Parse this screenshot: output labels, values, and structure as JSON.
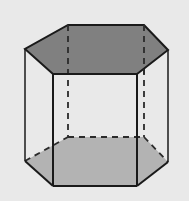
{
  "figure": {
    "canvas": {
      "width": 189,
      "height": 201
    },
    "background_color": "#e9e9e9",
    "colors": {
      "background": "#e9e9e9",
      "top_face_fill": "#808080",
      "bottom_face_fill": "#b3b3b3",
      "front_faces_fill": "#e9e9e9",
      "visible_edge": "#1a1a1a",
      "hidden_edge": "#2b2b2b"
    },
    "stroke": {
      "visible_width": 2.0,
      "hidden_width": 1.8,
      "hidden_dash": "6,5",
      "thin_width": 1.3
    },
    "geometry": {
      "top_hexagon": {
        "label": "top face",
        "fill": "#808080",
        "vertices": [
          {
            "name": "top-back-left",
            "x": 68,
            "y": 25
          },
          {
            "name": "top-back-right",
            "x": 144,
            "y": 25
          },
          {
            "name": "top-right",
            "x": 168,
            "y": 50
          },
          {
            "name": "top-front-right",
            "x": 137,
            "y": 74
          },
          {
            "name": "top-front-left",
            "x": 53,
            "y": 74
          },
          {
            "name": "top-left",
            "x": 25,
            "y": 49
          }
        ]
      },
      "bottom_hexagon": {
        "label": "bottom face",
        "fill": "#b3b3b3",
        "vertices": [
          {
            "name": "bottom-back-left",
            "x": 68,
            "y": 137
          },
          {
            "name": "bottom-back-right",
            "x": 144,
            "y": 137
          },
          {
            "name": "bottom-right",
            "x": 168,
            "y": 162
          },
          {
            "name": "bottom-front-right",
            "x": 137,
            "y": 186
          },
          {
            "name": "bottom-front-left",
            "x": 53,
            "y": 186
          },
          {
            "name": "bottom-left",
            "x": 25,
            "y": 161
          }
        ]
      },
      "vertical_edges": [
        {
          "name": "edge-back-left",
          "x1": 68,
          "y1": 25,
          "x2": 68,
          "y2": 137,
          "hidden": true
        },
        {
          "name": "edge-back-right",
          "x1": 144,
          "y1": 25,
          "x2": 144,
          "y2": 137,
          "hidden": true
        },
        {
          "name": "edge-right",
          "x1": 168,
          "y1": 50,
          "x2": 168,
          "y2": 162,
          "hidden": false
        },
        {
          "name": "edge-front-right",
          "x1": 137,
          "y1": 74,
          "x2": 137,
          "y2": 186,
          "hidden": false
        },
        {
          "name": "edge-front-left",
          "x1": 53,
          "y1": 74,
          "x2": 53,
          "y2": 186,
          "hidden": false
        },
        {
          "name": "edge-left",
          "x1": 25,
          "y1": 49,
          "x2": 25,
          "y2": 161,
          "hidden": false
        }
      ],
      "hidden_bottom_edges": [
        {
          "name": "bottom-edge-back-left",
          "x1": 25,
          "y1": 161,
          "x2": 68,
          "y2": 137
        },
        {
          "name": "bottom-edge-back",
          "x1": 68,
          "y1": 137,
          "x2": 144,
          "y2": 137
        },
        {
          "name": "bottom-edge-back-right",
          "x1": 144,
          "y1": 137,
          "x2": 168,
          "y2": 162
        }
      ],
      "visible_bottom_edges": [
        {
          "name": "bottom-edge-front-left",
          "x1": 25,
          "y1": 161,
          "x2": 53,
          "y2": 186
        },
        {
          "name": "bottom-edge-front",
          "x1": 53,
          "y1": 186,
          "x2": 137,
          "y2": 186
        },
        {
          "name": "bottom-edge-front-right",
          "x1": 137,
          "y1": 186,
          "x2": 168,
          "y2": 162
        }
      ],
      "face_count": 8,
      "vertex_count": 12,
      "edge_count": 18
    }
  }
}
